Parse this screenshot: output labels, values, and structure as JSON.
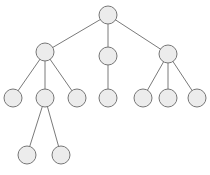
{
  "diagram": {
    "type": "tree",
    "colors": {
      "node_fill": "#ececec",
      "node_stroke": "#777777",
      "edge": "#7a7a7a"
    },
    "nodes": [
      {
        "id": "root"
      },
      {
        "id": "a"
      },
      {
        "id": "b"
      },
      {
        "id": "c"
      },
      {
        "id": "a1"
      },
      {
        "id": "a2"
      },
      {
        "id": "a3"
      },
      {
        "id": "b1"
      },
      {
        "id": "c1"
      },
      {
        "id": "c2"
      },
      {
        "id": "c3"
      },
      {
        "id": "a2x"
      },
      {
        "id": "a2y"
      }
    ],
    "edges": [
      [
        "root",
        "a"
      ],
      [
        "root",
        "b"
      ],
      [
        "root",
        "c"
      ],
      [
        "a",
        "a1"
      ],
      [
        "a",
        "a2"
      ],
      [
        "a",
        "a3"
      ],
      [
        "b",
        "b1"
      ],
      [
        "c",
        "c1"
      ],
      [
        "c",
        "c2"
      ],
      [
        "c",
        "c3"
      ],
      [
        "a2",
        "a2x"
      ],
      [
        "a2",
        "a2y"
      ]
    ]
  }
}
